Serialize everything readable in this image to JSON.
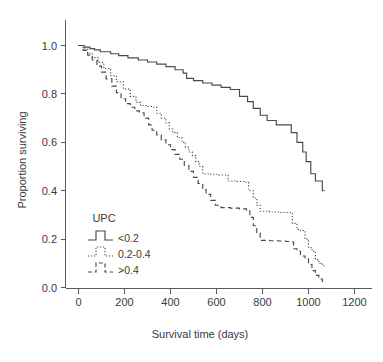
{
  "chart_data": {
    "type": "line",
    "subtype": "kaplan-meier-step",
    "title": "",
    "xlabel": "Survival time (days)",
    "ylabel": "Proportion surviving",
    "xlim": [
      0,
      1280
    ],
    "ylim": [
      0.0,
      1.0
    ],
    "xticks": [
      0,
      200,
      400,
      600,
      800,
      1000,
      1200
    ],
    "xtick_labels": [
      "0",
      "200",
      "400",
      "600",
      "800",
      "1000",
      "1200"
    ],
    "yticks": [
      0.0,
      0.2,
      0.4,
      0.6,
      0.8,
      1.0
    ],
    "ytick_labels": [
      "0.0",
      "0.2",
      "0.4",
      "0.6",
      "0.8",
      "1.0"
    ],
    "grid": false,
    "legend_position": "lower-left-inside",
    "legend_title": "UPC",
    "line_color": "#4a4a4a",
    "axis_color": "#595959",
    "series": [
      {
        "name": "<0.2",
        "style": "solid",
        "points": [
          [
            0,
            1.0
          ],
          [
            25,
            0.993
          ],
          [
            50,
            0.987
          ],
          [
            70,
            0.982
          ],
          [
            95,
            0.974
          ],
          [
            140,
            0.966
          ],
          [
            175,
            0.958
          ],
          [
            215,
            0.949
          ],
          [
            260,
            0.94
          ],
          [
            300,
            0.932
          ],
          [
            340,
            0.923
          ],
          [
            380,
            0.913
          ],
          [
            420,
            0.9
          ],
          [
            455,
            0.886
          ],
          [
            470,
            0.864
          ],
          [
            500,
            0.855
          ],
          [
            540,
            0.845
          ],
          [
            580,
            0.836
          ],
          [
            620,
            0.827
          ],
          [
            660,
            0.818
          ],
          [
            700,
            0.79
          ],
          [
            735,
            0.768
          ],
          [
            760,
            0.74
          ],
          [
            790,
            0.712
          ],
          [
            820,
            0.69
          ],
          [
            860,
            0.672
          ],
          [
            900,
            0.672
          ],
          [
            925,
            0.64
          ],
          [
            950,
            0.6
          ],
          [
            975,
            0.56
          ],
          [
            990,
            0.52
          ],
          [
            1010,
            0.47
          ],
          [
            1030,
            0.44
          ],
          [
            1045,
            0.44
          ],
          [
            1060,
            0.4
          ],
          [
            1070,
            0.4
          ]
        ]
      },
      {
        "name": "0.2-0.4",
        "style": "dotted",
        "points": [
          [
            0,
            1.0
          ],
          [
            20,
            0.985
          ],
          [
            40,
            0.968
          ],
          [
            60,
            0.95
          ],
          [
            85,
            0.93
          ],
          [
            110,
            0.905
          ],
          [
            140,
            0.875
          ],
          [
            165,
            0.85
          ],
          [
            195,
            0.82
          ],
          [
            225,
            0.79
          ],
          [
            250,
            0.765
          ],
          [
            270,
            0.752
          ],
          [
            300,
            0.748
          ],
          [
            320,
            0.745
          ],
          [
            340,
            0.72
          ],
          [
            360,
            0.7
          ],
          [
            380,
            0.68
          ],
          [
            395,
            0.655
          ],
          [
            410,
            0.64
          ],
          [
            430,
            0.62
          ],
          [
            450,
            0.6
          ],
          [
            465,
            0.58
          ],
          [
            480,
            0.56
          ],
          [
            495,
            0.545
          ],
          [
            510,
            0.52
          ],
          [
            525,
            0.5
          ],
          [
            540,
            0.47
          ],
          [
            570,
            0.468
          ],
          [
            610,
            0.465
          ],
          [
            625,
            0.465
          ],
          [
            650,
            0.44
          ],
          [
            690,
            0.438
          ],
          [
            720,
            0.435
          ],
          [
            740,
            0.4
          ],
          [
            760,
            0.37
          ],
          [
            775,
            0.34
          ],
          [
            790,
            0.315
          ],
          [
            830,
            0.312
          ],
          [
            880,
            0.31
          ],
          [
            910,
            0.31
          ],
          [
            930,
            0.265
          ],
          [
            950,
            0.24
          ],
          [
            965,
            0.235
          ],
          [
            985,
            0.2
          ],
          [
            1000,
            0.165
          ],
          [
            1015,
            0.15
          ],
          [
            1030,
            0.115
          ],
          [
            1045,
            0.1
          ],
          [
            1060,
            0.09
          ],
          [
            1070,
            0.085
          ]
        ]
      },
      {
        "name": ">0.4",
        "style": "dashed",
        "points": [
          [
            0,
            1.0
          ],
          [
            20,
            0.98
          ],
          [
            40,
            0.96
          ],
          [
            60,
            0.94
          ],
          [
            80,
            0.915
          ],
          [
            100,
            0.89
          ],
          [
            120,
            0.862
          ],
          [
            145,
            0.832
          ],
          [
            165,
            0.805
          ],
          [
            185,
            0.78
          ],
          [
            205,
            0.76
          ],
          [
            225,
            0.745
          ],
          [
            245,
            0.73
          ],
          [
            265,
            0.722
          ],
          [
            285,
            0.7
          ],
          [
            305,
            0.672
          ],
          [
            320,
            0.65
          ],
          [
            340,
            0.63
          ],
          [
            360,
            0.61
          ],
          [
            380,
            0.59
          ],
          [
            400,
            0.57
          ],
          [
            420,
            0.55
          ],
          [
            440,
            0.53
          ],
          [
            460,
            0.505
          ],
          [
            480,
            0.48
          ],
          [
            500,
            0.455
          ],
          [
            520,
            0.43
          ],
          [
            540,
            0.405
          ],
          [
            555,
            0.385
          ],
          [
            575,
            0.36
          ],
          [
            595,
            0.34
          ],
          [
            620,
            0.33
          ],
          [
            660,
            0.328
          ],
          [
            700,
            0.325
          ],
          [
            730,
            0.32
          ],
          [
            745,
            0.29
          ],
          [
            760,
            0.255
          ],
          [
            775,
            0.225
          ],
          [
            790,
            0.195
          ],
          [
            830,
            0.193
          ],
          [
            870,
            0.192
          ],
          [
            900,
            0.19
          ],
          [
            920,
            0.188
          ],
          [
            935,
            0.16
          ],
          [
            950,
            0.15
          ],
          [
            965,
            0.13
          ],
          [
            985,
            0.118
          ],
          [
            1000,
            0.095
          ],
          [
            1015,
            0.07
          ],
          [
            1030,
            0.05
          ],
          [
            1045,
            0.035
          ],
          [
            1060,
            0.025
          ],
          [
            1070,
            0.022
          ]
        ]
      }
    ],
    "legend_entries": [
      {
        "label": "<0.2",
        "style": "solid"
      },
      {
        "label": "0.2-0.4",
        "style": "dotted"
      },
      {
        "label": ">0.4",
        "style": "dashed"
      }
    ]
  }
}
